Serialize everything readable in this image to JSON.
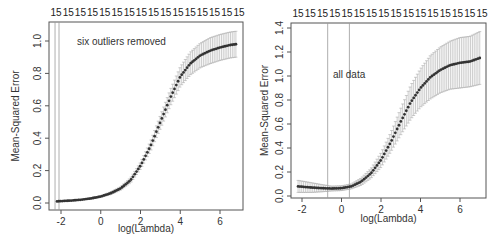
{
  "chart_data": [
    {
      "type": "line",
      "title": "",
      "annotation": "six outliers removed",
      "xlabel": "log(Lambda)",
      "ylabel": "Mean-Squared Error",
      "xlim": [
        -2.4,
        7.2
      ],
      "ylim": [
        -0.02,
        1.1
      ],
      "xticks": [
        -2,
        0,
        2,
        4,
        6
      ],
      "xtick_labels": [
        "-2",
        "0",
        "2",
        "4",
        "6"
      ],
      "yticks": [
        0.0,
        0.2,
        0.4,
        0.6,
        0.8,
        1.0
      ],
      "ytick_labels": [
        "0.0",
        "0.2",
        "0.4",
        "0.6",
        "0.8",
        "1.0"
      ],
      "top_axis_labels": [
        "15",
        "15",
        "15",
        "15",
        "15",
        "15",
        "15",
        "15",
        "15",
        "15",
        "15",
        "15",
        "15",
        "15",
        "15",
        "15"
      ],
      "vlines": [
        -2.3,
        -2.1
      ],
      "grid": false,
      "series": [
        {
          "name": "CV mean-squared error",
          "x": [
            -2.2,
            -1.5,
            -1.0,
            -0.5,
            0.0,
            0.5,
            1.0,
            1.5,
            2.0,
            2.5,
            3.0,
            3.5,
            4.0,
            4.5,
            5.0,
            5.5,
            6.0,
            6.5,
            6.8
          ],
          "y": [
            0.01,
            0.015,
            0.02,
            0.028,
            0.04,
            0.06,
            0.09,
            0.14,
            0.23,
            0.35,
            0.5,
            0.65,
            0.78,
            0.86,
            0.91,
            0.94,
            0.96,
            0.975,
            0.98
          ],
          "err": [
            0.0,
            0.0,
            0.0,
            0.005,
            0.005,
            0.008,
            0.01,
            0.015,
            0.02,
            0.03,
            0.04,
            0.05,
            0.06,
            0.07,
            0.075,
            0.08,
            0.08,
            0.08,
            0.08
          ]
        }
      ]
    },
    {
      "type": "line",
      "title": "",
      "annotation": "all data",
      "xlabel": "log(Lambda)",
      "ylabel": "Mean-Squared Error",
      "xlim": [
        -2.5,
        7.3
      ],
      "ylim": [
        -0.02,
        1.43
      ],
      "xticks": [
        -2,
        0,
        2,
        4,
        6
      ],
      "xtick_labels": [
        "-2",
        "0",
        "2",
        "4",
        "6"
      ],
      "yticks": [
        0.0,
        0.2,
        0.4,
        0.6,
        0.8,
        1.0,
        1.2,
        1.4
      ],
      "ytick_labels": [
        "0.0",
        "0.2",
        "0.4",
        "0.6",
        "0.8",
        "1.0",
        "1.2",
        "1.4"
      ],
      "top_axis_labels": [
        "15",
        "15",
        "15",
        "15",
        "15",
        "15",
        "15",
        "15",
        "15",
        "15",
        "15",
        "15",
        "15",
        "15",
        "15",
        "15"
      ],
      "vlines": [
        -0.7,
        0.4
      ],
      "grid": false,
      "series": [
        {
          "name": "CV mean-squared error",
          "x": [
            -2.2,
            -1.5,
            -1.0,
            -0.5,
            0.0,
            0.5,
            1.0,
            1.5,
            2.0,
            2.5,
            3.0,
            3.5,
            4.0,
            4.5,
            5.0,
            5.5,
            6.0,
            6.5,
            7.0
          ],
          "y": [
            0.08,
            0.07,
            0.065,
            0.062,
            0.065,
            0.08,
            0.12,
            0.19,
            0.3,
            0.45,
            0.62,
            0.78,
            0.9,
            0.99,
            1.05,
            1.09,
            1.11,
            1.12,
            1.15
          ],
          "err": [
            0.05,
            0.04,
            0.03,
            0.02,
            0.02,
            0.02,
            0.03,
            0.04,
            0.06,
            0.08,
            0.11,
            0.14,
            0.16,
            0.18,
            0.19,
            0.2,
            0.21,
            0.21,
            0.22
          ]
        }
      ]
    }
  ],
  "colors": {
    "line": "#333333",
    "errorbar": "#aaaaaa",
    "frame": "#555555",
    "vline": "#999999"
  }
}
